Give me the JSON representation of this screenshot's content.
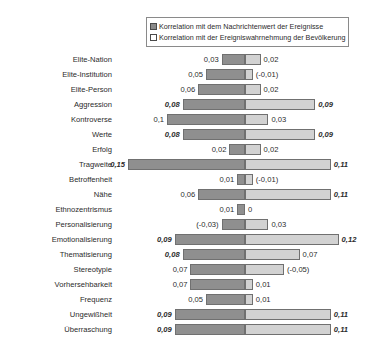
{
  "legend": {
    "items": [
      {
        "key": "series-a",
        "label": "Korrelation mit dem Nachrichtenwert der Ereignisse",
        "color": "#8f8f8f"
      },
      {
        "key": "series-b",
        "label": "Korrelation mit der Ereigniswahrnehmung der Bevölkerung",
        "color": "#d2d2d2"
      }
    ]
  },
  "chart_data": {
    "type": "bar",
    "orientation": "horizontal",
    "layout": "diverging-back-to-back",
    "title": "",
    "xlabel": "",
    "ylabel": "",
    "grid": false,
    "legend_position": "top",
    "axis_center": 0,
    "categories": [
      "Elite-Nation",
      "Elite-Institution",
      "Elite-Person",
      "Aggression",
      "Kontroverse",
      "Werte",
      "Erfolg",
      "Tragweite",
      "Betroffenheit",
      "Nähe",
      "Ethnozentrismus",
      "Personalisierung",
      "Emotionalisierung",
      "Thematisierung",
      "Stereotypie",
      "Vorhersehbarkeit",
      "Frequenz",
      "Ungewißheit",
      "Überraschung"
    ],
    "series": [
      {
        "name": "Korrelation mit dem Nachrichtenwert der Ereignisse",
        "direction": "left",
        "values": [
          0.03,
          0.05,
          0.06,
          0.08,
          0.1,
          0.08,
          0.02,
          0.15,
          0.01,
          0.06,
          0.01,
          -0.03,
          0.09,
          0.08,
          0.07,
          0.07,
          0.05,
          0.09,
          0.09
        ],
        "labels": [
          "0,03",
          "0,05",
          "0,06",
          "0,08",
          "0,1",
          "0,08",
          "0,02",
          "0,15",
          "0,01",
          "0,06",
          "0,01",
          "(-0,03)",
          "0,09",
          "0,08",
          "0,07",
          "0,07",
          "0,05",
          "0,09",
          "0,09"
        ],
        "emphasis": [
          false,
          false,
          false,
          true,
          false,
          true,
          false,
          true,
          false,
          false,
          false,
          false,
          true,
          true,
          false,
          false,
          false,
          true,
          true
        ]
      },
      {
        "name": "Korrelation mit der Ereigniswahrnehmung der Bevölkerung",
        "direction": "right",
        "values": [
          0.02,
          -0.01,
          0.02,
          0.09,
          0.03,
          0.09,
          0.02,
          0.11,
          -0.01,
          0.11,
          0.0,
          0.03,
          0.12,
          0.07,
          -0.05,
          0.01,
          0.01,
          0.11,
          0.11
        ],
        "labels": [
          "0,02",
          "(-0,01)",
          "0,02",
          "0,09",
          "0,03",
          "0,09",
          "0,02",
          "0,11",
          "(-0,01)",
          "0,11",
          "0",
          "0,03",
          "0,12",
          "0,07",
          "(-0,05)",
          "0,01",
          "0,01",
          "0,11",
          "0,11"
        ],
        "emphasis": [
          false,
          false,
          false,
          true,
          false,
          true,
          false,
          true,
          false,
          true,
          false,
          false,
          true,
          false,
          false,
          false,
          false,
          true,
          true
        ]
      }
    ]
  }
}
